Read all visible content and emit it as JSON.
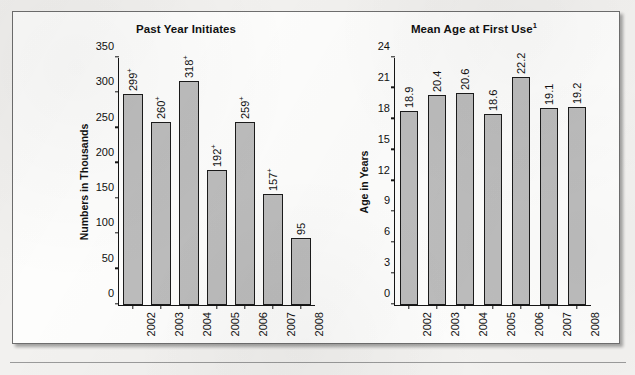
{
  "figure": {
    "background_color": "#fdfdfc",
    "bar_fill_color": "#bcbcbc",
    "bar_edge_color": "#1b1b1b",
    "axis_color": "#151515"
  },
  "chart_data": [
    {
      "type": "bar",
      "panel": "left",
      "title": "Past Year Initiates",
      "title_superscript": "",
      "xlabel": "",
      "ylabel": "Numbers in Thousands",
      "categories": [
        "2002",
        "2003",
        "2004",
        "2005",
        "2006",
        "2007",
        "2008"
      ],
      "values": [
        299,
        260,
        318,
        192,
        259,
        157,
        95
      ],
      "value_labels": [
        "299",
        "260",
        "318",
        "192",
        "259",
        "157",
        "95"
      ],
      "value_label_superscripts": [
        "+",
        "+",
        "+",
        "+",
        "+",
        "+",
        ""
      ],
      "ylim": [
        0,
        350
      ],
      "yticks": [
        0,
        50,
        100,
        150,
        200,
        250,
        300,
        350
      ],
      "ytick_labels": [
        "0",
        "50",
        "100",
        "150",
        "200",
        "250",
        "300",
        "350"
      ],
      "grid": false,
      "legend": "none"
    },
    {
      "type": "bar",
      "panel": "right",
      "title": "Mean Age at First Use",
      "title_superscript": "1",
      "xlabel": "",
      "ylabel": "Age in Years",
      "categories": [
        "2002",
        "2003",
        "2004",
        "2005",
        "2006",
        "2007",
        "2008"
      ],
      "values": [
        18.9,
        20.4,
        20.6,
        18.6,
        22.2,
        19.1,
        19.2
      ],
      "value_labels": [
        "18.9",
        "20.4",
        "20.6",
        "18.6",
        "22.2",
        "19.1",
        "19.2"
      ],
      "value_label_superscripts": [
        "",
        "",
        "",
        "",
        "",
        "",
        ""
      ],
      "ylim": [
        0,
        24
      ],
      "yticks": [
        0,
        3,
        6,
        9,
        12,
        15,
        18,
        21,
        24
      ],
      "ytick_labels": [
        "0",
        "3",
        "6",
        "9",
        "12",
        "15",
        "18",
        "21",
        "24"
      ],
      "grid": false,
      "legend": "none"
    }
  ]
}
